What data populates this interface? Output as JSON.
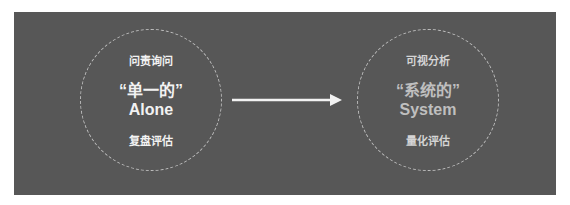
{
  "diagram": {
    "colors": {
      "background": "#575757",
      "circle_border": "#bdbdbd",
      "arrow": "#f2f2f2"
    },
    "left_node": {
      "top_label": "问责询问",
      "title_cn": "“单一的”",
      "title_en": "Alone",
      "bottom_label": "复盘评估"
    },
    "arrow": {
      "direction": "right"
    },
    "right_node": {
      "top_label": "可视分析",
      "title_cn": "“系统的”",
      "title_en": "System",
      "bottom_label": "量化评估"
    }
  }
}
